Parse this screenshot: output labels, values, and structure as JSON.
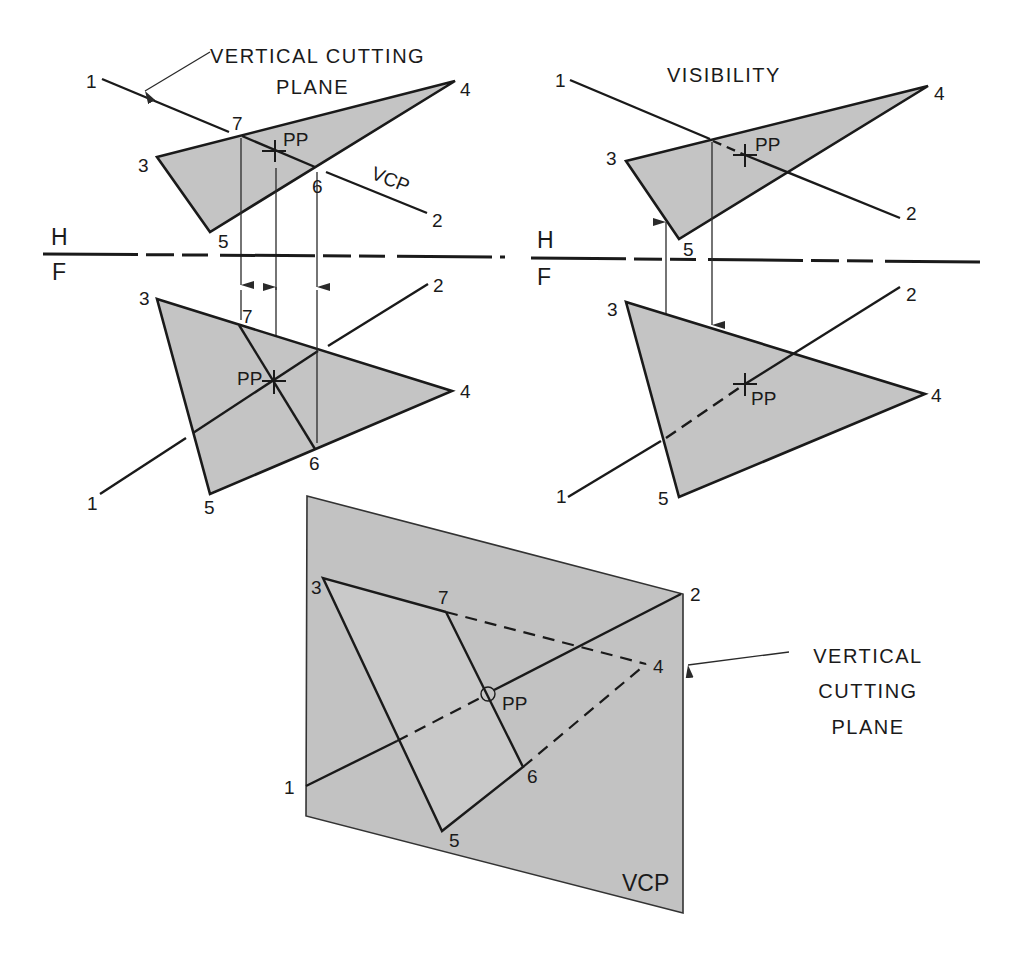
{
  "labels": {
    "vcp_caption_top_line1": "VERTICAL CUTTING",
    "vcp_caption_top_line2": "PLANE",
    "visibility": "VISIBILITY",
    "vcp_short": "VCP",
    "pp": "PP",
    "h": "H",
    "f": "F",
    "vcp_caption_right_line1": "VERTICAL",
    "vcp_caption_right_line2": "CUTTING",
    "vcp_caption_right_line3": "PLANE",
    "vcp_plane_label": "VCP"
  },
  "points": {
    "p1": "1",
    "p2": "2",
    "p3": "3",
    "p4": "4",
    "p5": "5",
    "p6": "6",
    "p7": "7"
  },
  "views": [
    {
      "name": "top-left",
      "view": "horizontal",
      "caption": "VERTICAL CUTTING PLANE"
    },
    {
      "name": "top-right",
      "view": "horizontal",
      "caption": "VISIBILITY"
    },
    {
      "name": "bottom-left",
      "view": "frontal"
    },
    {
      "name": "bottom-right",
      "view": "frontal"
    },
    {
      "name": "pictorial",
      "view": "vertical cutting plane",
      "caption": "VERTICAL CUTTING PLANE"
    }
  ],
  "colors": {
    "fill": "#c4c4c4",
    "line": "#1a1a1a",
    "background": "#ffffff"
  }
}
